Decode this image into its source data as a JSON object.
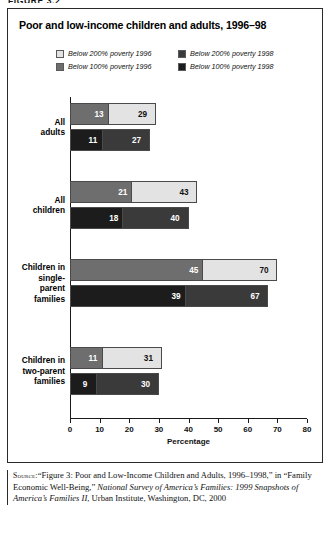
{
  "figure_caption": "FIGURE 3.2",
  "chart": {
    "title": "Poor and low-income children and adults, 1996–98",
    "legend": [
      {
        "label": "Below 200% poverty 1996",
        "color": "#e3e3e3"
      },
      {
        "label": "Below 200% poverty 1998",
        "color": "#3a3a3a"
      },
      {
        "label": "Below 100% poverty 1996",
        "color": "#6e6e6e"
      },
      {
        "label": "Below 100% poverty 1998",
        "color": "#1c1c1c"
      }
    ],
    "x_axis_title": "Percentage",
    "x_ticks": [
      "0",
      "10",
      "20",
      "30",
      "40",
      "50",
      "60",
      "70",
      "80"
    ],
    "categories": [
      "All\nadults",
      "All\nchildren",
      "Children in\nsingle-\nparent\nfamilies",
      "Children in\ntwo-parent\nfamilies"
    ]
  },
  "chart_data": {
    "type": "bar",
    "orientation": "horizontal",
    "title": "Poor and low-income children and adults, 1996–98",
    "subtitle": "",
    "xlabel": "Percentage",
    "ylabel": "",
    "xlim": [
      0,
      80
    ],
    "xticks": [
      0,
      10,
      20,
      30,
      40,
      50,
      60,
      70,
      80
    ],
    "grid": false,
    "legend_position": "top",
    "note": "Each category shows two rows (1996 and 1998); within each row the 100% poverty bar is overlaid on the wider 200% poverty bar.",
    "categories": [
      "All adults",
      "All children",
      "Children in single-parent families",
      "Children in two-parent families"
    ],
    "series": [
      {
        "name": "Below 200% poverty 1996",
        "color": "#e3e3e3",
        "year": 1996,
        "threshold": "200%",
        "values": [
          29,
          43,
          70,
          31
        ]
      },
      {
        "name": "Below 100% poverty 1996",
        "color": "#6e6e6e",
        "year": 1996,
        "threshold": "100%",
        "values": [
          13,
          21,
          45,
          11
        ]
      },
      {
        "name": "Below 200% poverty 1998",
        "color": "#3a3a3a",
        "year": 1998,
        "threshold": "200%",
        "values": [
          27,
          40,
          67,
          30
        ]
      },
      {
        "name": "Below 100% poverty 1998",
        "color": "#1c1c1c",
        "year": 1998,
        "threshold": "100%",
        "values": [
          11,
          18,
          39,
          9
        ]
      }
    ]
  },
  "source": {
    "label": "Source:",
    "text_1": "“Figure 3: Poor and Low-Income Children and Adults, 1996–1998,” in “Family Economic Well-Being,” ",
    "italic_title": "National Survey of America’s Families: 1999 Snapshots of America’s Families II",
    "text_2": ", Urban Institute, Washington, DC, 2000"
  }
}
